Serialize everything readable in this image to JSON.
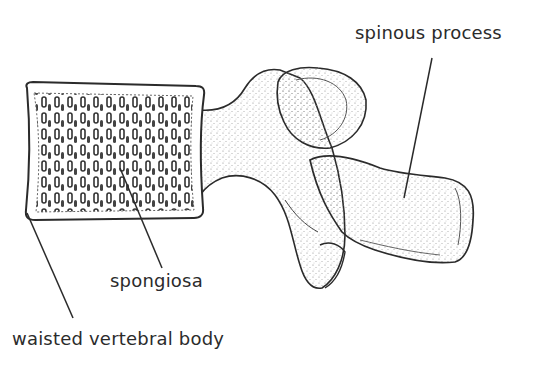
{
  "figure": {
    "labels": [
      {
        "id": "spinous",
        "text": "spinous process"
      },
      {
        "id": "spongiosa",
        "text": "spongiosa"
      },
      {
        "id": "waisted",
        "text": "waisted vertebral body"
      }
    ]
  },
  "colors": {
    "outline": "#2b2b2b",
    "stipple": "#8a8a8a",
    "background": "#ffffff"
  }
}
